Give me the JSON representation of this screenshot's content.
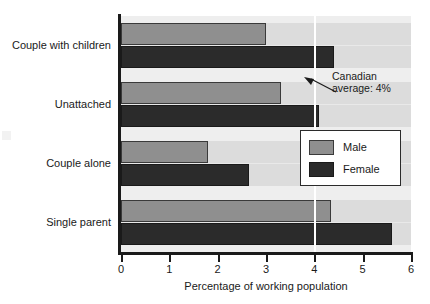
{
  "chart_data": {
    "type": "bar",
    "orientation": "horizontal",
    "title": "",
    "xlabel": "Percentage of working population",
    "ylabel": "",
    "xlim": [
      0,
      6
    ],
    "xticks": [
      0,
      1,
      2,
      3,
      4,
      5,
      6
    ],
    "xtick_labels": [
      "0",
      "1",
      "2",
      "3",
      "4",
      "5",
      "6"
    ],
    "grid": false,
    "legend_position": "right-middle",
    "categories": [
      "Couple with children",
      "Unattached",
      "Couple alone",
      "Single parent"
    ],
    "series": [
      {
        "name": "Male",
        "color": "#8f8f8f",
        "values": [
          3.0,
          3.3,
          1.8,
          4.35
        ]
      },
      {
        "name": "Female",
        "color": "#2b2b2b",
        "values": [
          4.4,
          4.1,
          2.65,
          5.6
        ]
      }
    ],
    "annotations": [
      {
        "name": "canadian-average",
        "text_line1": "Canadian",
        "text_line2": "average: 4%",
        "value": 4,
        "line_color": "#ffffff"
      }
    ]
  },
  "axis": {
    "x_title": "Percentage of working population",
    "tick_labels": [
      "0",
      "1",
      "2",
      "3",
      "4",
      "5",
      "6"
    ]
  },
  "categories": [
    {
      "label": "Couple with children"
    },
    {
      "label": "Unattached"
    },
    {
      "label": "Couple alone"
    },
    {
      "label": "Single parent"
    }
  ],
  "legend": {
    "items": [
      {
        "label": "Male"
      },
      {
        "label": "Female"
      }
    ]
  },
  "annotation": {
    "line1": "Canadian",
    "line2": "average: 4%"
  },
  "colors": {
    "male": "#8f8f8f",
    "female": "#2b2b2b",
    "plot_background": "#e9e9e9",
    "band_light": "#eeeeee",
    "band_dark": "#dcdcdc",
    "axis": "#1a1a1a",
    "reference_line": "#ffffff"
  }
}
